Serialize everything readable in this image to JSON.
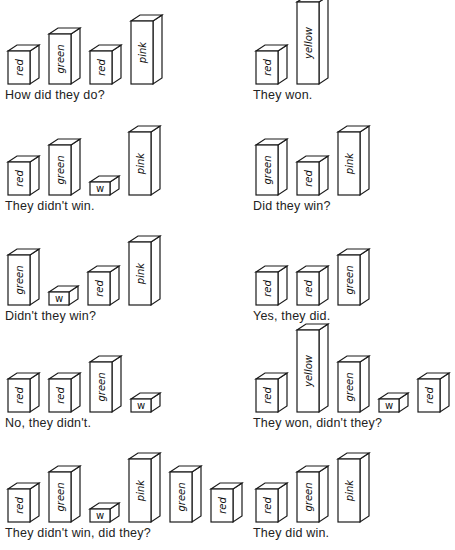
{
  "colors": {
    "line": "#1a1a1a",
    "background": "#ffffff",
    "text": "#222222"
  },
  "block_geometry": {
    "front_width": 22,
    "depth_x": 9,
    "depth_y": 6,
    "heights": {
      "short": 27,
      "medium": 48,
      "tall": 48,
      "very_tall": 70,
      "cube": 13
    }
  },
  "panels": [
    {
      "id": "p1",
      "column": "left",
      "x": 8,
      "baseline": 92,
      "caption": "How did they do?",
      "blocks": [
        {
          "label": "red",
          "h": 33
        },
        {
          "label": "green",
          "h": 50
        },
        {
          "label": "red",
          "h": 33
        },
        {
          "label": "pink",
          "h": 63
        }
      ]
    },
    {
      "id": "p2",
      "column": "right",
      "x": 256,
      "baseline": 92,
      "caption": "They won.",
      "blocks": [
        {
          "label": "red",
          "h": 33
        },
        {
          "label": "yellow",
          "h": 82
        }
      ]
    },
    {
      "id": "p3",
      "column": "left",
      "x": 8,
      "baseline": 203,
      "caption": "They didn't win.",
      "blocks": [
        {
          "label": "red",
          "h": 33
        },
        {
          "label": "green",
          "h": 50
        },
        {
          "label": "w",
          "h": 13
        },
        {
          "label": "pink",
          "h": 63
        }
      ]
    },
    {
      "id": "p4",
      "column": "right",
      "x": 256,
      "baseline": 203,
      "caption": "Did they win?",
      "blocks": [
        {
          "label": "green",
          "h": 50
        },
        {
          "label": "red",
          "h": 33
        },
        {
          "label": "pink",
          "h": 63
        }
      ]
    },
    {
      "id": "p5",
      "column": "left",
      "x": 8,
      "baseline": 313,
      "caption": "Didn't they win?",
      "blocks": [
        {
          "label": "green",
          "h": 50
        },
        {
          "label": "w",
          "h": 13
        },
        {
          "label": "red",
          "h": 33
        },
        {
          "label": "pink",
          "h": 63
        }
      ]
    },
    {
      "id": "p6",
      "column": "right",
      "x": 256,
      "baseline": 313,
      "caption": "Yes, they did.",
      "blocks": [
        {
          "label": "red",
          "h": 33
        },
        {
          "label": "red",
          "h": 33
        },
        {
          "label": "green",
          "h": 50
        }
      ]
    },
    {
      "id": "p7",
      "column": "left",
      "x": 8,
      "baseline": 420,
      "caption": "No, they didn't.",
      "blocks": [
        {
          "label": "red",
          "h": 33
        },
        {
          "label": "red",
          "h": 33
        },
        {
          "label": "green",
          "h": 50
        },
        {
          "label": "w",
          "h": 13
        }
      ]
    },
    {
      "id": "p8",
      "column": "right",
      "x": 256,
      "baseline": 420,
      "caption": "They won, didn't they?",
      "blocks": [
        {
          "label": "red",
          "h": 33
        },
        {
          "label": "yellow",
          "h": 82
        },
        {
          "label": "green",
          "h": 50
        },
        {
          "label": "w",
          "h": 13
        },
        {
          "label": "red",
          "h": 33
        }
      ]
    },
    {
      "id": "p9",
      "column": "left",
      "x": 8,
      "baseline": 530,
      "caption": "They didn't win, did they?",
      "blocks": [
        {
          "label": "red",
          "h": 33
        },
        {
          "label": "green",
          "h": 50
        },
        {
          "label": "w",
          "h": 13
        },
        {
          "label": "pink",
          "h": 63
        },
        {
          "label": "green",
          "h": 50
        },
        {
          "label": "red",
          "h": 33
        }
      ]
    },
    {
      "id": "p10",
      "column": "right",
      "x": 256,
      "baseline": 530,
      "caption": "They did win.",
      "blocks": [
        {
          "label": "red",
          "h": 33
        },
        {
          "label": "green",
          "h": 50
        },
        {
          "label": "pink",
          "h": 63
        }
      ]
    }
  ]
}
